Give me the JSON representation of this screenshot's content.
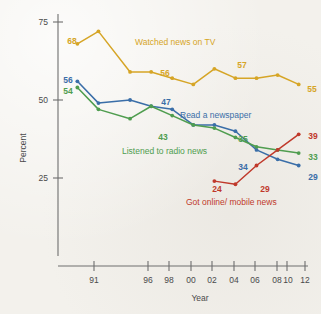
{
  "chart_data": {
    "type": "line",
    "title": "",
    "xlabel": "Year",
    "ylabel": "Percent",
    "xlim": [
      1990,
      2012.6
    ],
    "ylim": [
      0,
      78
    ],
    "yticks": [
      25,
      50,
      75
    ],
    "ytick_labels": [
      "25",
      "50",
      "75"
    ],
    "xticks": [
      1991,
      1996,
      1998,
      2000,
      2002,
      2004,
      2006,
      2008,
      2010,
      2012
    ],
    "xtick_labels": [
      "91",
      "96",
      "98",
      "00",
      "02",
      "04",
      "06",
      "08",
      "10",
      "12"
    ],
    "grid": false,
    "legend_position": "inline-annotations",
    "series": [
      {
        "name": "Watched news on TV",
        "color": "#d6a526",
        "x": [
          1991,
          1993,
          1996,
          1998,
          2000,
          2002,
          2004,
          2006,
          2008,
          2010,
          2012
        ],
        "values": [
          68,
          72,
          59,
          59,
          57,
          55,
          60,
          57,
          57,
          58,
          55
        ],
        "label_text": "Watched news on TV",
        "point_labels": [
          {
            "x": 1991,
            "value": 68,
            "text": "68"
          },
          {
            "x": 2000,
            "value": 57,
            "text": "56"
          },
          {
            "x": 2008,
            "value": 57,
            "text": "57"
          },
          {
            "x": 2012,
            "value": 55,
            "text": "55"
          }
        ]
      },
      {
        "name": "Read a newspaper",
        "color": "#3a6ea8",
        "x": [
          1991,
          1993,
          1996,
          1998,
          2000,
          2002,
          2004,
          2006,
          2008,
          2010,
          2012
        ],
        "values": [
          56,
          49,
          50,
          48,
          47,
          42,
          42,
          40,
          34,
          31,
          29
        ],
        "label_text": "Read a newspaper",
        "point_labels": [
          {
            "x": 1991,
            "value": 56,
            "text": "56"
          },
          {
            "x": 1999,
            "value": 47,
            "text": "47"
          },
          {
            "x": 2008,
            "value": 34,
            "text": "34"
          },
          {
            "x": 2012,
            "value": 29,
            "text": "29"
          }
        ]
      },
      {
        "name": "Listened to radio news",
        "color": "#4f9d4f",
        "x": [
          1991,
          1993,
          1996,
          1998,
          2000,
          2002,
          2004,
          2006,
          2008,
          2010,
          2012
        ],
        "values": [
          54,
          47,
          44,
          48,
          45,
          42,
          41,
          38,
          35,
          34,
          33
        ],
        "label_text": "Listened to radio news",
        "point_labels": [
          {
            "x": 1991,
            "value": 54,
            "text": "54"
          },
          {
            "x": 2000,
            "value": 43,
            "text": "43"
          },
          {
            "x": 2006,
            "value": 35,
            "text": "35"
          },
          {
            "x": 2012,
            "value": 33,
            "text": "33"
          }
        ]
      },
      {
        "name": "Got online/ mobile news",
        "color": "#c0392b",
        "x": [
          2004,
          2006,
          2008,
          2010,
          2012
        ],
        "values": [
          24,
          23,
          29,
          34,
          39
        ],
        "label_text": "Got online/ mobile news",
        "point_labels": [
          {
            "x": 2004,
            "value": 24,
            "text": "24"
          },
          {
            "x": 2008,
            "value": 29,
            "text": "29"
          },
          {
            "x": 2012,
            "value": 39,
            "text": "39"
          }
        ]
      }
    ]
  },
  "axes": {
    "y_title": "Percent",
    "x_title": "Year",
    "y_tick_0": "25",
    "y_tick_1": "50",
    "y_tick_2": "75",
    "x_tick_0": "91",
    "x_tick_1": "96",
    "x_tick_2": "98",
    "x_tick_3": "00",
    "x_tick_4": "02",
    "x_tick_5": "04",
    "x_tick_6": "06",
    "x_tick_7": "08",
    "x_tick_8": "10",
    "x_tick_9": "12"
  },
  "annotations": {
    "tv_label": "Watched news on TV",
    "newspaper_label": "Read a newspaper",
    "radio_label": "Listened to radio news",
    "online_label": "Got online/ mobile news",
    "tv_68": "68",
    "tv_56": "56",
    "tv_57": "57",
    "tv_55": "55",
    "np_56": "56",
    "np_47": "47",
    "np_34": "34",
    "np_29": "29",
    "rd_54": "54",
    "rd_43": "43",
    "rd_35": "35",
    "rd_33": "33",
    "on_24": "24",
    "on_29": "29",
    "on_39": "39"
  },
  "colors": {
    "tv": "#d6a526",
    "newspaper": "#3a6ea8",
    "radio": "#4f9d4f",
    "online": "#c0392b",
    "axis": "#6e6e6e",
    "background": "#f3f1ec"
  }
}
